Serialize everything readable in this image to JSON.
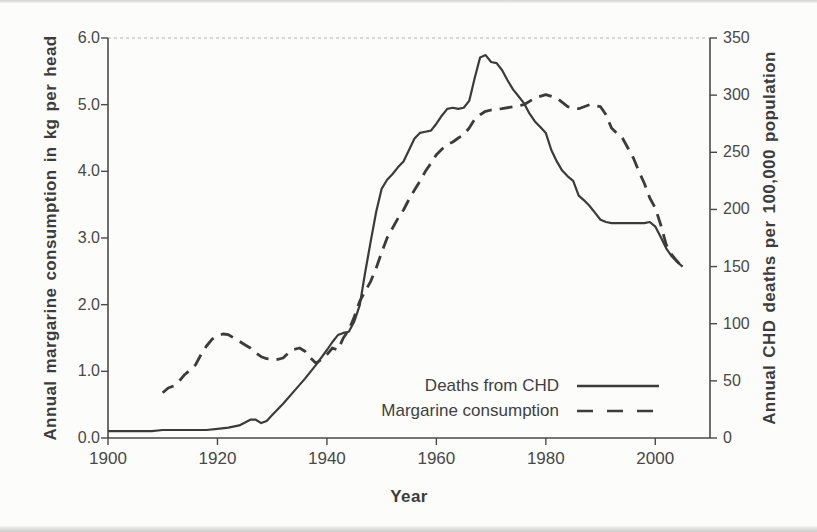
{
  "chart_data": {
    "type": "line",
    "xlabel": "Year",
    "xlim": [
      1900,
      2010
    ],
    "x_ticks": [
      "1900",
      "1920",
      "1940",
      "1960",
      "1980",
      "2000"
    ],
    "left_axis": {
      "label": "Annual margarine consumption in kg per head",
      "lim": [
        0,
        6
      ],
      "ticks": [
        "0.0",
        "1.0",
        "2.0",
        "3.0",
        "4.0",
        "5.0",
        "6.0"
      ]
    },
    "right_axis": {
      "label": "Annual CHD deaths per 100,000 population",
      "lim": [
        0,
        350
      ],
      "ticks": [
        "0",
        "50",
        "100",
        "150",
        "200",
        "250",
        "300",
        "350"
      ]
    },
    "colors": {
      "line": "#3b3b3b",
      "top_border": "#b4b4b4",
      "background": "#fcfcfb"
    },
    "grid": "off",
    "legend": {
      "position": "lower right",
      "entries": [
        "Deaths from CHD",
        "Margarine consumption"
      ]
    },
    "series": [
      {
        "name": "Deaths from CHD",
        "axis": "right",
        "style": "solid",
        "x": [
          1900,
          1902,
          1904,
          1906,
          1908,
          1910,
          1912,
          1914,
          1916,
          1918,
          1920,
          1922,
          1924,
          1926,
          1927,
          1928,
          1929,
          1930,
          1932,
          1934,
          1936,
          1938,
          1940,
          1941,
          1942,
          1943,
          1944,
          1945,
          1946,
          1947,
          1948,
          1949,
          1950,
          1951,
          1952,
          1953,
          1954,
          1955,
          1956,
          1957,
          1958,
          1959,
          1960,
          1961,
          1962,
          1963,
          1964,
          1965,
          1966,
          1967,
          1968,
          1969,
          1970,
          1971,
          1972,
          1973,
          1974,
          1975,
          1976,
          1977,
          1978,
          1979,
          1980,
          1981,
          1982,
          1983,
          1984,
          1985,
          1986,
          1987,
          1988,
          1989,
          1990,
          1991,
          1992,
          1993,
          1994,
          1995,
          1996,
          1997,
          1998,
          1999,
          2000,
          2001,
          2002,
          2003,
          2004,
          2005
        ],
        "values": [
          6,
          6,
          6,
          6,
          6,
          7,
          7,
          7,
          7,
          7,
          8,
          9,
          11,
          16,
          16,
          13,
          15,
          20,
          30,
          41,
          52,
          64,
          77,
          84,
          90,
          92,
          93,
          102,
          116,
          145,
          172,
          198,
          218,
          226,
          231,
          237,
          242,
          252,
          262,
          267,
          268,
          269,
          275,
          282,
          288,
          289,
          288,
          289,
          295,
          315,
          333,
          335,
          329,
          328,
          322,
          313,
          305,
          299,
          293,
          284,
          277,
          272,
          267,
          252,
          242,
          234,
          229,
          225,
          212,
          208,
          203,
          197,
          191,
          189,
          188,
          188,
          188,
          188,
          188,
          188,
          188,
          189,
          185,
          176,
          166,
          159,
          154,
          150
        ]
      },
      {
        "name": "Margarine consumption",
        "axis": "left",
        "style": "dashed",
        "x": [
          1910,
          1911,
          1912,
          1913,
          1914,
          1915,
          1916,
          1917,
          1918,
          1919,
          1920,
          1921,
          1922,
          1923,
          1924,
          1925,
          1926,
          1927,
          1928,
          1929,
          1930,
          1931,
          1932,
          1933,
          1934,
          1935,
          1936,
          1937,
          1938,
          1939,
          1940,
          1941,
          1942,
          1943,
          1944,
          1945,
          1946,
          1947,
          1948,
          1949,
          1950,
          1951,
          1952,
          1953,
          1954,
          1955,
          1956,
          1957,
          1958,
          1959,
          1960,
          1961,
          1962,
          1963,
          1964,
          1965,
          1966,
          1967,
          1968,
          1969,
          1970,
          1972,
          1974,
          1976,
          1978,
          1980,
          1982,
          1984,
          1986,
          1988,
          1990,
          1991,
          1992,
          1993,
          1994,
          1995,
          1996,
          1997,
          1998,
          1999,
          2000,
          2001,
          2002,
          2003,
          2004,
          2005
        ],
        "values": [
          0.68,
          0.75,
          0.78,
          0.85,
          0.95,
          1.02,
          1.1,
          1.25,
          1.38,
          1.48,
          1.53,
          1.56,
          1.55,
          1.5,
          1.45,
          1.4,
          1.35,
          1.28,
          1.22,
          1.19,
          1.18,
          1.18,
          1.2,
          1.28,
          1.33,
          1.35,
          1.3,
          1.2,
          1.12,
          1.18,
          1.25,
          1.35,
          1.32,
          1.5,
          1.62,
          1.82,
          2.05,
          2.2,
          2.35,
          2.55,
          2.78,
          3.0,
          3.15,
          3.3,
          3.42,
          3.58,
          3.72,
          3.85,
          4.0,
          4.12,
          4.25,
          4.33,
          4.4,
          4.44,
          4.5,
          4.55,
          4.65,
          4.78,
          4.85,
          4.9,
          4.92,
          4.94,
          4.97,
          5.0,
          5.1,
          5.15,
          5.1,
          4.97,
          4.94,
          5.0,
          4.97,
          4.85,
          4.65,
          4.57,
          4.5,
          4.35,
          4.2,
          4.0,
          3.82,
          3.6,
          3.45,
          3.2,
          2.9,
          2.75,
          2.65,
          2.56
        ]
      }
    ]
  }
}
